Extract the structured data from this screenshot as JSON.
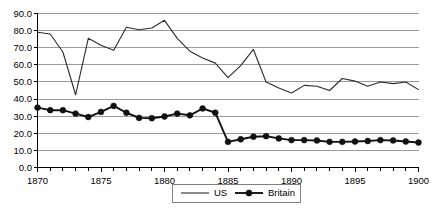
{
  "chart_data": {
    "type": "line",
    "title": "",
    "subtitle": "",
    "xlabel": "",
    "ylabel": "",
    "xlim": [
      1870,
      1900
    ],
    "ylim": [
      0.0,
      90.0
    ],
    "grid": true,
    "legend_position": "bottom",
    "x": [
      1870,
      1871,
      1872,
      1873,
      1874,
      1875,
      1876,
      1877,
      1878,
      1879,
      1880,
      1881,
      1882,
      1883,
      1884,
      1885,
      1886,
      1887,
      1888,
      1889,
      1890,
      1891,
      1892,
      1893,
      1894,
      1895,
      1896,
      1897,
      1898,
      1899,
      1900
    ],
    "x_tick_labels": [
      "1870",
      "1875",
      "1880",
      "1885",
      "1890",
      "1895",
      "1900"
    ],
    "x_tick_values": [
      1870,
      1875,
      1880,
      1885,
      1890,
      1895,
      1900
    ],
    "y_tick_labels": [
      "0.0",
      "10.0",
      "20.0",
      "30.0",
      "40.0",
      "50.0",
      "60.0",
      "70.0",
      "80.0",
      "90.0"
    ],
    "y_tick_values": [
      0.0,
      10.0,
      20.0,
      30.0,
      40.0,
      50.0,
      60.0,
      70.0,
      80.0,
      90.0
    ],
    "series": [
      {
        "name": "US",
        "marker": "none",
        "color": "#2b2b2b",
        "values": [
          79.0,
          78.0,
          67.5,
          42.5,
          75.5,
          71.5,
          68.5,
          82.0,
          80.5,
          81.5,
          86.0,
          75.5,
          68.0,
          64.0,
          61.0,
          52.5,
          59.5,
          69.0,
          50.0,
          46.5,
          43.5,
          48.0,
          47.5,
          45.0,
          52.0,
          50.5,
          47.5,
          50.0,
          49.0,
          50.0,
          45.5
        ]
      },
      {
        "name": "Britain",
        "marker": "circle",
        "color": "#111111",
        "values": [
          35.0,
          33.5,
          33.5,
          31.5,
          29.5,
          32.5,
          36.0,
          32.0,
          29.0,
          28.8,
          29.8,
          31.5,
          30.5,
          34.5,
          32.0,
          15.0,
          16.5,
          18.0,
          18.3,
          17.0,
          16.0,
          16.0,
          15.8,
          15.0,
          15.0,
          15.2,
          15.5,
          16.0,
          15.8,
          15.2,
          14.6
        ]
      }
    ],
    "legend": [
      {
        "label": "US",
        "style": "line"
      },
      {
        "label": "Britain",
        "style": "line-marker"
      }
    ]
  },
  "colors": {
    "gridline": "#9a9a9a",
    "axis": "#000000",
    "us": "#2b2b2b",
    "britain": "#111111",
    "background": "#ffffff",
    "legend_border": "#808080"
  }
}
